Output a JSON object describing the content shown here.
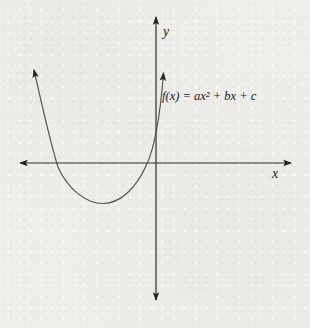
{
  "figure": {
    "y_axis_label": "y",
    "x_axis_label": "x",
    "function_label": "f(x) = ax² + bx + c",
    "colors": {
      "background": "#efeeea",
      "axis": "#2e2e2e",
      "curve": "#4f4f4f",
      "text": "#1c1c1c"
    },
    "curve": {
      "shape": "upward-opening parabola",
      "x_intercepts": "two, both left of the origin",
      "y_intercept": "positive (curve crosses y-axis above x-axis)",
      "vertex_position": "below x-axis, left of y-axis"
    }
  }
}
